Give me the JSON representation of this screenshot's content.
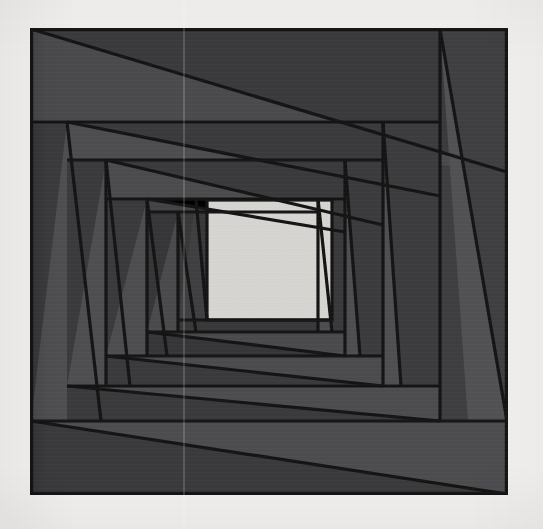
{
  "artwork": {
    "title": "Nested Rotating Squares",
    "alt_title": "Spiral Vortex Square Illusion",
    "medium_note": "scanned print",
    "canvas": {
      "width": 543,
      "height": 529
    },
    "background_color": "#f1f0ee",
    "stroke_color": "#141414",
    "stroke_width": 3.2,
    "frame": {
      "x": 30,
      "y": 28,
      "width": 478,
      "height": 467
    },
    "center_square": {
      "name": "center-light-square",
      "x": 207,
      "y": 200,
      "width": 125,
      "height": 120,
      "fill": "#d3d2cf"
    },
    "palette": {
      "dark": "#3a3a3c",
      "darker": "#323234",
      "mid": "#424244",
      "light": "#4e4e50",
      "lighter": "#565658",
      "highlight": "#d3d2cf",
      "ink": "#141414",
      "paper": "#f1f0ee"
    },
    "rings": [
      {
        "index": 0,
        "name": "ring-outer",
        "outer_rect": {
          "x": 30,
          "y": 28,
          "width": 478,
          "height": 467
        },
        "inner_quad": "106,102 477,102 477,468 66,468",
        "fill_band": "#434345",
        "fill_wedge": "#393a3c"
      },
      {
        "index": 1,
        "name": "ring-2",
        "outer_rect": {
          "x": 66,
          "y": 102,
          "width": 411,
          "height": 366
        },
        "inner_quad": "106,160 407,160 407,412 106,412",
        "fill_band": "#4d4d4f",
        "fill_wedge": "#3c3c3e"
      },
      {
        "index": 2,
        "name": "ring-3",
        "outer_rect": {
          "x": 106,
          "y": 160,
          "width": 301,
          "height": 252
        },
        "inner_quad": "166,200 367,200 367,355 166,355",
        "fill_band": "#3a3a3c",
        "fill_wedge": "#4a4a4c"
      },
      {
        "index": 3,
        "name": "ring-4",
        "outer_rect": {
          "x": 166,
          "y": 200,
          "width": 201,
          "height": 155
        },
        "inner_quad": "207,200 332,200 332,320 207,320",
        "fill_band": "#44444 6",
        "fill_wedge": "#353537"
      }
    ],
    "shapes": [
      {
        "name": "outer-border-rect",
        "type": "rect",
        "x": 30,
        "y": 28,
        "w": 478,
        "h": 467,
        "fill": "#3c3c3e"
      },
      {
        "name": "band-top-outer",
        "type": "poly",
        "points": "32,30 506,30 506,173 32,122",
        "fill": "#47474a"
      },
      {
        "name": "wedge-top-outer",
        "type": "poly",
        "points": "32,30 506,173 506,30",
        "fill": "#3a3a3c"
      },
      {
        "name": "band-right-outer",
        "type": "poly",
        "points": "440,30 506,30 506,493 468,493",
        "fill": "#4d4d50"
      },
      {
        "name": "wedge-right-outer",
        "type": "poly",
        "points": "440,30 506,30 506,493",
        "fill": "#414143"
      },
      {
        "name": "band-bottom-outer",
        "type": "poly",
        "points": "32,420 506,420 506,493 32,493",
        "fill": "#4a4a4d"
      },
      {
        "name": "wedge-bottom-outer",
        "type": "poly",
        "points": "32,420 506,493 32,493",
        "fill": "#393a3c"
      },
      {
        "name": "band-left-outer",
        "type": "poly",
        "points": "32,122 66,122 100,420 32,420",
        "fill": "#3b3b3d"
      },
      {
        "name": "wedge-left-outer",
        "type": "poly",
        "points": "66,122 100,420 32,420",
        "fill": "#4d4d50"
      },
      {
        "name": "band-top-ring2",
        "type": "poly",
        "points": "105,104 383,104 383,222 105,160",
        "fill": "#4a4a4d"
      },
      {
        "name": "wedge-top-ring2",
        "type": "poly",
        "points": "105,104 383,222 383,104",
        "fill": "#3b3b3d"
      },
      {
        "name": "band-right-ring2",
        "type": "poly",
        "points": "383,104 440,104 440,420 398,420",
        "fill": "#3c3c3e"
      },
      {
        "name": "wedge-right-ring2",
        "type": "poly",
        "points": "383,104 398,420 383,420",
        "fill": "#4e4e51"
      },
      {
        "name": "band-bottom-ring2",
        "type": "poly",
        "points": "105,385 440,385 440,420 105,420",
        "fill": "#4b4b4e"
      },
      {
        "name": "wedge-bottom-ring2",
        "type": "poly",
        "points": "105,385 440,420 105,420",
        "fill": "#3a3a3c"
      },
      {
        "name": "band-left-ring2",
        "type": "poly",
        "points": "105,104 136,104 160,385 105,385",
        "fill": "#3a3a3c"
      },
      {
        "name": "wedge-left-ring2",
        "type": "poly",
        "points": "136,104 160,385 105,385",
        "fill": "#4d4d50"
      },
      {
        "name": "band-top-ring3",
        "type": "poly",
        "points": "146,162 332,162 332,242 146,200",
        "fill": "#3c3c3e"
      },
      {
        "name": "wedge-top-ring3",
        "type": "poly",
        "points": "146,162 332,242 332,162",
        "fill": "#4b4b4e"
      },
      {
        "name": "band-right-ring3",
        "type": "poly",
        "points": "332,162 383,162 383,355 352,355",
        "fill": "#4c4c4f"
      },
      {
        "name": "wedge-right-ring3",
        "type": "poly",
        "points": "332,162 352,355 332,355",
        "fill": "#3a3a3c"
      },
      {
        "name": "band-bottom-ring3",
        "type": "poly",
        "points": "146,320 383,320 383,355 146,355",
        "fill": "#3a3a3c"
      },
      {
        "name": "wedge-bottom-ring3",
        "type": "poly",
        "points": "146,320 383,355 146,355",
        "fill": "#4c4c4f"
      },
      {
        "name": "band-left-ring3",
        "type": "poly",
        "points": "146,162 168,162 184,320 146,320",
        "fill": "#4b4b4e"
      },
      {
        "name": "wedge-left-ring3",
        "type": "poly",
        "points": "168,162 184,320 146,320",
        "fill": "#3a3a3c"
      },
      {
        "name": "band-top-ring4",
        "type": "poly",
        "points": "186,202 300,202 300,238 186,222",
        "fill": "#46464 8",
        "fill_fix": "#464648"
      },
      {
        "name": "center-square-shape",
        "type": "rect",
        "x": 207,
        "y": 200,
        "w": 125,
        "h": 120,
        "fill": "#d3d2cf"
      }
    ],
    "labels": {
      "caption": "",
      "signature": ""
    }
  }
}
